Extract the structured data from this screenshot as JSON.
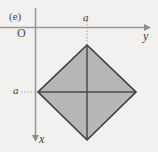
{
  "figure": {
    "panel_label": "(e)",
    "origin_label": "O",
    "background_color": "#f2f1ef",
    "axes": {
      "horizontal": {
        "name": "y-axis",
        "label": "y",
        "direction": "right",
        "color": "#9a9a9a",
        "y": 27,
        "x_start": 0,
        "x_end": 148
      },
      "vertical": {
        "name": "x-axis",
        "label": "x",
        "direction": "down",
        "color": "#9a9a9a",
        "x": 36,
        "y_start": 8,
        "y_end": 140
      }
    },
    "dimension_labels": [
      {
        "text": "a",
        "position": "top",
        "note": "distance from origin along y to diamond top vertex"
      },
      {
        "text": "a",
        "position": "left",
        "note": "distance from origin along x to diamond left vertex"
      }
    ],
    "shape": {
      "name": "diamond",
      "type": "square rotated 45 degrees",
      "fill_color": "#b6b6b6",
      "stroke_color": "#3a3a3a",
      "vertices": [
        {
          "name": "top",
          "x": 87,
          "y": 45
        },
        {
          "name": "right",
          "x": 136,
          "y": 92
        },
        {
          "name": "bottom",
          "x": 87,
          "y": 140
        },
        {
          "name": "left",
          "x": 38,
          "y": 92
        }
      ],
      "center": {
        "x": 87,
        "y": 92
      },
      "diagonals": [
        {
          "name": "vertical-diagonal",
          "from": "top",
          "to": "bottom"
        },
        {
          "name": "horizontal-diagonal",
          "from": "left",
          "to": "right"
        }
      ]
    },
    "leader_lines": [
      {
        "name": "top-dotted-leader",
        "from_x": 87,
        "from_y": 22,
        "to_x": 87,
        "to_y": 45,
        "style": "dotted"
      },
      {
        "name": "left-dotted-leader",
        "from_x": 22,
        "from_y": 92,
        "to_x": 38,
        "to_y": 92,
        "style": "dotted"
      }
    ]
  }
}
